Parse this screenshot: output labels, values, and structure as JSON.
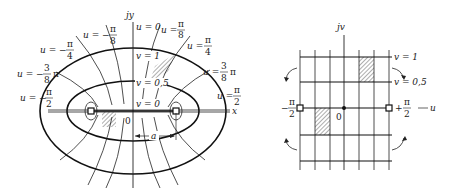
{
  "left_diagram": {
    "axis_y_label": "jy",
    "axis_x_label": "x",
    "origin_label": "0",
    "distance_label": "a",
    "v_labels": [
      {
        "text": "v = 1"
      },
      {
        "text": "v = 0,5"
      },
      {
        "text": "v = 0"
      }
    ],
    "u_labels": [
      {
        "prefix": "u = 0",
        "num": "",
        "den": "",
        "suffix": ""
      },
      {
        "prefix": "u =",
        "num": "π",
        "den": "8",
        "suffix": ""
      },
      {
        "prefix": "u =",
        "num": "π",
        "den": "4",
        "suffix": ""
      },
      {
        "prefix": "u =",
        "num": "3",
        "den": "8",
        "suffix": "π"
      },
      {
        "prefix": "u =",
        "num": "π",
        "den": "2",
        "suffix": ""
      },
      {
        "prefix": "u = −",
        "num": "π",
        "den": "8",
        "suffix": ""
      },
      {
        "prefix": "u = −",
        "num": "π",
        "den": "4",
        "suffix": ""
      },
      {
        "prefix": "u = −",
        "num": "3",
        "den": "8",
        "suffix": "π"
      },
      {
        "prefix": "u = −",
        "num": "π",
        "den": "2",
        "suffix": ""
      }
    ]
  },
  "right_diagram": {
    "axis_v_label": "jv",
    "axis_u_label": "u",
    "origin_label": "0",
    "v_labels": [
      {
        "text": "v = 1"
      },
      {
        "text": "v = 0,5"
      }
    ],
    "left_bound": {
      "sign": "−",
      "num": "π",
      "den": "2"
    },
    "right_bound": {
      "sign": "+",
      "num": "π",
      "den": "2"
    }
  },
  "colors": {
    "ink": "#222222",
    "background": "#ffffff"
  }
}
